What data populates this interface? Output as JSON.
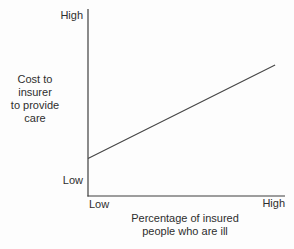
{
  "figure": {
    "y_axis": {
      "tick_top": "High",
      "tick_bottom": "Low",
      "title_lines": [
        "Cost to",
        "insurer",
        "to provide",
        "care"
      ]
    },
    "x_axis": {
      "tick_left": "Low",
      "tick_right": "High",
      "title_lines": [
        "Percentage of insured",
        "people who are ill"
      ]
    }
  },
  "colors": {
    "line": "#454545",
    "axis": "#3f3f3f",
    "text": "#2e2e2e",
    "background": "#fdfdfd"
  },
  "chart_data": {
    "type": "line",
    "title": "",
    "xlabel": "Percentage of insured people who are ill",
    "ylabel": "Cost to insurer to provide care",
    "x_tick_labels": [
      "Low",
      "High"
    ],
    "y_tick_labels": [
      "Low",
      "High"
    ],
    "axes_qualitative": true,
    "grid": false,
    "legend": false,
    "relationship": "positive linear",
    "series": [
      {
        "name": "Cost to insurer vs percentage of insured people who are ill",
        "points_normalized": [
          {
            "x": 0.0,
            "y": 0.2
          },
          {
            "x": 0.95,
            "y": 0.7
          }
        ]
      }
    ]
  }
}
